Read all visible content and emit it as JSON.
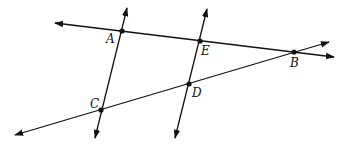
{
  "diagram": {
    "type": "geometry-lines",
    "stroke_color": "#111111",
    "points": {
      "A": {
        "label": "A",
        "x": 122,
        "y": 31
      },
      "B": {
        "label": "B",
        "x": 294,
        "y": 52
      },
      "C": {
        "label": "C",
        "x": 101,
        "y": 110
      },
      "D": {
        "label": "D",
        "x": 189,
        "y": 84
      },
      "E": {
        "label": "E",
        "x": 200,
        "y": 41
      }
    },
    "lines": [
      {
        "name": "line-AB",
        "through": [
          "A",
          "E",
          "B"
        ],
        "from": [
          55,
          23
        ],
        "to": [
          334,
          57
        ],
        "arrows": "both"
      },
      {
        "name": "line-CB",
        "through": [
          "C",
          "D",
          "B"
        ],
        "from": [
          15,
          135
        ],
        "to": [
          329,
          42
        ],
        "arrows": "both"
      },
      {
        "name": "line-AC",
        "through": [
          "A",
          "C"
        ],
        "from": [
          127,
          8
        ],
        "to": [
          95,
          138
        ],
        "arrows": "both"
      },
      {
        "name": "line-ED",
        "through": [
          "E",
          "D"
        ],
        "from": [
          207,
          9
        ],
        "to": [
          175,
          138
        ],
        "arrows": "both"
      }
    ]
  }
}
